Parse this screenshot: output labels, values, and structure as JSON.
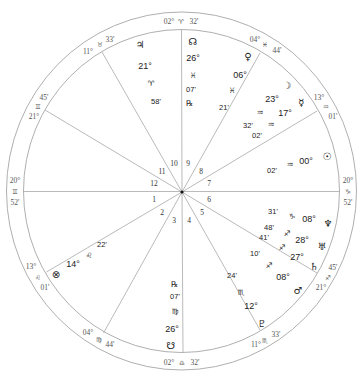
{
  "chart": {
    "cusps": {
      "mc": {
        "deg": "02°",
        "sign": "♈",
        "min": "32'"
      },
      "ic": {
        "deg": "02°",
        "sign": "♎",
        "min": "32'"
      },
      "asc": {
        "deg": "20°",
        "sign": "♊",
        "min": "52'"
      },
      "dsc": {
        "deg": "20°",
        "sign": "♑",
        "min": "52'"
      },
      "h11": {
        "deg": "11°",
        "sign": "♉",
        "min": "33'"
      },
      "h12": {
        "deg": "21°",
        "sign": "♊",
        "min": "45'"
      },
      "h2": {
        "deg": "13°",
        "sign": "♌",
        "min": "01'"
      },
      "h3": {
        "deg": "04°",
        "sign": "♍",
        "min": "44'"
      },
      "h5": {
        "deg": "11°",
        "sign": "♏",
        "min": "33'"
      },
      "h6": {
        "deg": "21°",
        "sign": "♐",
        "min": "45'"
      },
      "h8": {
        "deg": "13°",
        "sign": "♒",
        "min": "01'"
      },
      "h9": {
        "deg": "04°",
        "sign": "♓",
        "min": "44'"
      }
    },
    "house_numbers": [
      "1",
      "2",
      "3",
      "4",
      "5",
      "6",
      "7",
      "8",
      "9",
      "10",
      "11",
      "12"
    ],
    "planets": {
      "jupiter": {
        "glyph": "♃",
        "deg": "21°",
        "sign": "♈",
        "min": "58'"
      },
      "north_node": {
        "glyph": "☊",
        "deg": "26°",
        "sign": "♓",
        "min": "07'",
        "retro": "℞"
      },
      "venus": {
        "glyph": "♀",
        "deg": "06°",
        "sign": "♓",
        "min": "21'"
      },
      "moon": {
        "glyph": "☽",
        "deg": "23°",
        "sign": "♒",
        "min": "32'"
      },
      "mercury": {
        "glyph": "☿",
        "deg": "17°",
        "sign": "♒",
        "min": "02'"
      },
      "sun": {
        "glyph": "☉",
        "deg": "00°",
        "sign": "♒",
        "min": "02'"
      },
      "neptune": {
        "glyph": "♆",
        "deg": "08°",
        "sign": "♑",
        "min": "31'"
      },
      "uranus": {
        "glyph": "♅",
        "deg": "28°",
        "sign": "♐",
        "min": "48'"
      },
      "saturn": {
        "glyph": "♄",
        "deg": "27°",
        "sign": "♐",
        "min": "41'"
      },
      "mars": {
        "glyph": "♂",
        "deg": "08°",
        "sign": "♐",
        "min": "10'"
      },
      "pluto": {
        "glyph": "♇",
        "deg": "12°",
        "sign": "♏",
        "min": "24'"
      },
      "south_node": {
        "glyph": "☋",
        "deg": "26°",
        "sign": "♍",
        "min": "07'",
        "retro": "℞"
      },
      "part_of_fortune": {
        "glyph": "⊗",
        "deg": "14°",
        "sign": "♌",
        "min": "22'"
      }
    }
  }
}
